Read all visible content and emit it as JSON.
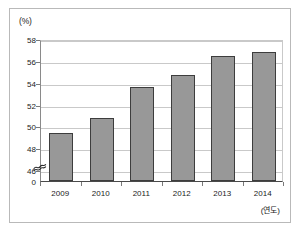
{
  "chart_data": {
    "type": "bar",
    "title": "",
    "subtitle": "",
    "xlabel": "(연도)",
    "ylabel": "(%)",
    "categories": [
      "2009",
      "2010",
      "2011",
      "2012",
      "2013",
      "2014"
    ],
    "values": [
      49.4,
      50.8,
      53.6,
      54.7,
      56.4,
      56.8
    ],
    "series": [
      {
        "name": "",
        "values": [
          49.4,
          50.8,
          53.6,
          54.7,
          56.4,
          56.8
        ]
      }
    ],
    "ylim": [
      45,
      58
    ],
    "y_ticks": [
      "58",
      "56",
      "54",
      "52",
      "50",
      "48",
      "46",
      "0"
    ],
    "y_tick_values": [
      58,
      56,
      54,
      52,
      50,
      48,
      46,
      0
    ],
    "y_axis_broken": true,
    "grid": true,
    "legend": "none",
    "bar_color": "#989898",
    "bar_border_color": "#3d3d3d",
    "grid_color": "#c9c9c9",
    "axis_color": "#4a4a4a",
    "background_color": "#ffffff",
    "frame_color": "#b9b9b9"
  },
  "axes": {
    "y_unit_label": "(%)",
    "x_unit_label": "(연도)"
  },
  "icons": {
    "axis_break": "axis-break-squiggle"
  }
}
